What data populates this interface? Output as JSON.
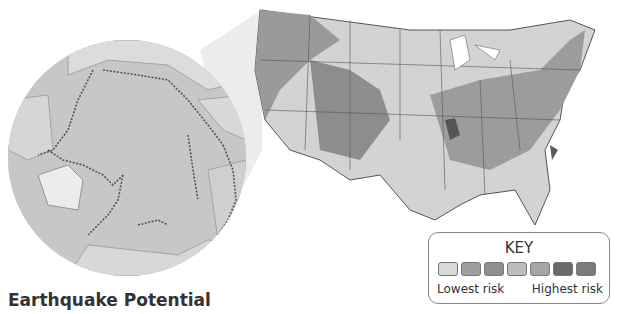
{
  "title": "Earthquake Potential",
  "key": {
    "title": "KEY",
    "low_label": "Lowest risk",
    "high_label": "Highest risk",
    "swatches": [
      "#d9d9d9",
      "#9f9f9f",
      "#8f8f8f",
      "#bdbdbd",
      "#a5a5a5",
      "#6a6a6a",
      "#7a7a7a"
    ]
  },
  "maps": {
    "globe": "Pacific Ring of Fire earthquake locations",
    "inset": "Contiguous United States earthquake risk zones"
  }
}
